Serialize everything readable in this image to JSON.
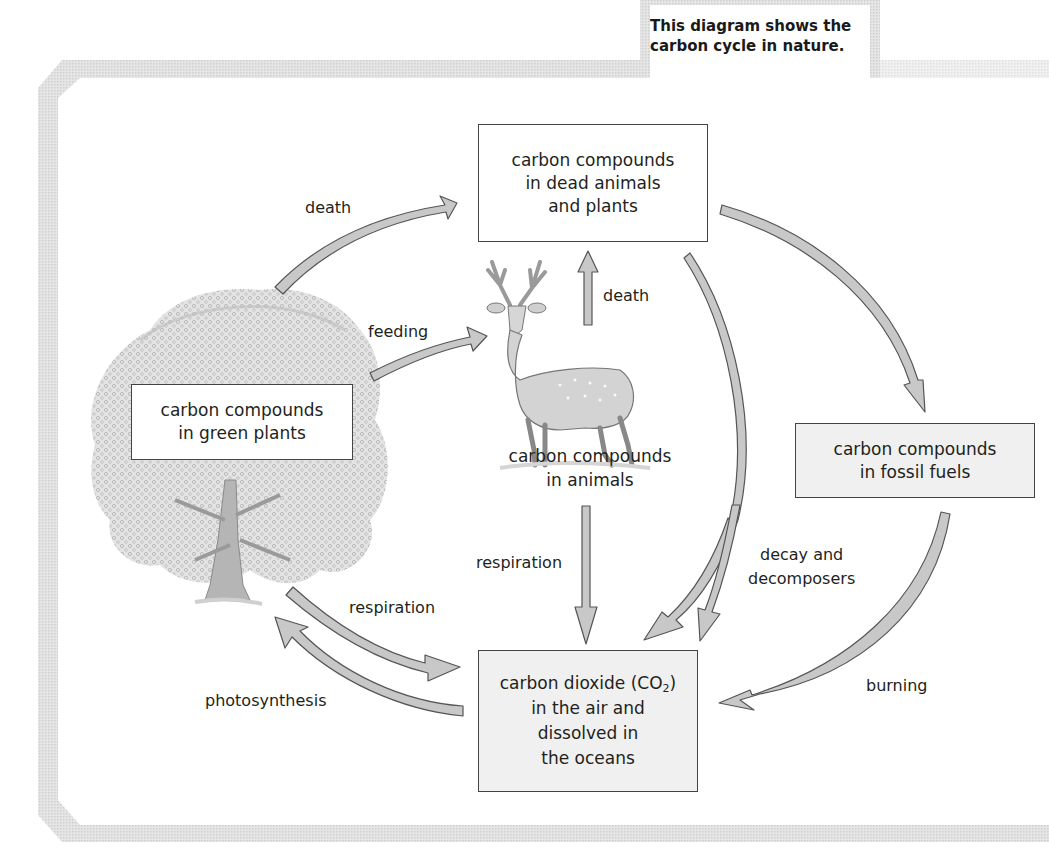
{
  "caption": {
    "line1": "This diagram shows the",
    "line2": "carbon cycle in nature."
  },
  "nodes": {
    "dead": {
      "lines": [
        "carbon compounds",
        "in dead animals",
        "and plants"
      ]
    },
    "plants": {
      "lines": [
        "carbon compounds",
        "in green plants"
      ]
    },
    "animals": {
      "lines": [
        "carbon compounds",
        "in animals"
      ]
    },
    "fossil": {
      "lines": [
        "carbon compounds",
        "in fossil fuels"
      ]
    },
    "co2": {
      "line1_prefix": "carbon dioxide (CO",
      "line1_sub": "2",
      "line1_suffix": ")",
      "lines": [
        "in the air and",
        "dissolved in",
        "the oceans"
      ]
    }
  },
  "arrows": {
    "death_plants": "death",
    "feeding": "feeding",
    "death_animals": "death",
    "respiration_animals": "respiration",
    "respiration_plants": "respiration",
    "photosynthesis": "photosynthesis",
    "decay_line1": "decay and",
    "decay_line2": "decomposers",
    "burning": "burning"
  },
  "colors": {
    "arrow_fill": "#c8c8c8",
    "arrow_stroke": "#555555",
    "frame": "#d4d4d4",
    "text": "#231f20"
  },
  "illustrations": {
    "tree": "tree-illustration",
    "deer": "deer-illustration"
  }
}
